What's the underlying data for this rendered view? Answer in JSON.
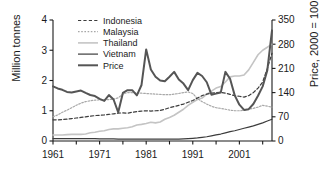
{
  "chart_data": {
    "type": "line",
    "title": "",
    "xlabel": "",
    "ylabel": "Million tonnes",
    "ylabel_right": "Price, 2000 = 100",
    "xlim": [
      1961,
      2008
    ],
    "ylim": [
      0,
      4
    ],
    "ylim_right": [
      0,
      350
    ],
    "yticks": [
      0,
      1,
      2,
      3,
      4
    ],
    "yticks_right": [
      0,
      70,
      140,
      210,
      280,
      350
    ],
    "xticks_labeled": [
      1961,
      1971,
      1981,
      1991,
      2001
    ],
    "xticks_minor_step": 5,
    "grid": false,
    "legend_position": "upper-left-inside",
    "x": [
      1961,
      1962,
      1963,
      1964,
      1965,
      1966,
      1967,
      1968,
      1969,
      1970,
      1971,
      1972,
      1973,
      1974,
      1975,
      1976,
      1977,
      1978,
      1979,
      1980,
      1981,
      1982,
      1983,
      1984,
      1985,
      1986,
      1987,
      1988,
      1989,
      1990,
      1991,
      1992,
      1993,
      1994,
      1995,
      1996,
      1997,
      1998,
      1999,
      2000,
      2001,
      2002,
      2003,
      2004,
      2005,
      2006,
      2007,
      2008
    ],
    "series": [
      {
        "name": "Indonesia",
        "axis": "left",
        "units": "Million tonnes",
        "style": "dashed",
        "color": "#3c3c3c",
        "width": 1.2,
        "values": [
          0.7,
          0.7,
          0.71,
          0.72,
          0.74,
          0.76,
          0.78,
          0.8,
          0.82,
          0.84,
          0.85,
          0.86,
          0.88,
          0.9,
          0.92,
          0.93,
          0.92,
          0.95,
          0.97,
          0.99,
          1.0,
          0.99,
          1.0,
          1.01,
          1.05,
          1.1,
          1.14,
          1.18,
          1.22,
          1.28,
          1.34,
          1.42,
          1.5,
          1.55,
          1.58,
          1.6,
          1.61,
          1.58,
          1.54,
          1.5,
          1.48,
          1.45,
          1.5,
          1.6,
          1.75,
          1.95,
          2.4,
          2.9
        ]
      },
      {
        "name": "Malaysia",
        "axis": "left",
        "units": "Million tonnes",
        "style": "dotted",
        "color": "#a8a8a8",
        "width": 1.2,
        "values": [
          0.8,
          0.86,
          0.95,
          1.02,
          1.1,
          1.18,
          1.25,
          1.3,
          1.33,
          1.35,
          1.36,
          1.37,
          1.37,
          1.38,
          1.43,
          1.55,
          1.6,
          1.6,
          1.59,
          1.58,
          1.57,
          1.56,
          1.55,
          1.54,
          1.53,
          1.53,
          1.55,
          1.57,
          1.6,
          1.62,
          1.57,
          1.4,
          1.3,
          1.22,
          1.15,
          1.1,
          1.08,
          1.05,
          1.02,
          1.0,
          1.0,
          1.02,
          1.05,
          1.08,
          1.12,
          1.18,
          1.15,
          1.12
        ]
      },
      {
        "name": "Thailand",
        "axis": "left",
        "units": "Million tonnes",
        "style": "solid",
        "color": "#c4c4c4",
        "width": 1.6,
        "values": [
          0.2,
          0.2,
          0.2,
          0.21,
          0.22,
          0.22,
          0.22,
          0.23,
          0.27,
          0.29,
          0.32,
          0.34,
          0.38,
          0.4,
          0.4,
          0.42,
          0.44,
          0.47,
          0.53,
          0.55,
          0.58,
          0.62,
          0.6,
          0.63,
          0.72,
          0.78,
          0.85,
          0.95,
          1.05,
          1.18,
          1.28,
          1.37,
          1.42,
          1.55,
          1.65,
          1.75,
          1.8,
          1.95,
          2.12,
          2.15,
          2.15,
          2.18,
          2.35,
          2.6,
          2.85,
          3.0,
          3.1,
          3.2
        ]
      },
      {
        "name": "Vietnam",
        "axis": "left",
        "units": "Million tonnes",
        "style": "solid",
        "color": "#3c3c3c",
        "width": 1.2,
        "values": [
          0.08,
          0.08,
          0.08,
          0.08,
          0.08,
          0.08,
          0.08,
          0.08,
          0.08,
          0.08,
          0.07,
          0.07,
          0.07,
          0.07,
          0.06,
          0.06,
          0.06,
          0.06,
          0.06,
          0.06,
          0.06,
          0.06,
          0.06,
          0.06,
          0.06,
          0.06,
          0.06,
          0.06,
          0.07,
          0.08,
          0.09,
          0.1,
          0.12,
          0.14,
          0.17,
          0.2,
          0.23,
          0.27,
          0.31,
          0.34,
          0.38,
          0.42,
          0.46,
          0.5,
          0.55,
          0.6,
          0.66,
          0.72
        ]
      },
      {
        "name": "Price",
        "axis": "right",
        "units": "Index, 2000 = 100",
        "style": "solid",
        "color": "#555555",
        "width": 2.0,
        "values": [
          158,
          152,
          148,
          142,
          140,
          143,
          146,
          139,
          133,
          130,
          122,
          116,
          133,
          120,
          83,
          139,
          147,
          147,
          132,
          162,
          265,
          207,
          186,
          175,
          173,
          186,
          200,
          178,
          166,
          147,
          176,
          197,
          188,
          170,
          134,
          137,
          140,
          200,
          180,
          132,
          105,
          90,
          92,
          107,
          131,
          158,
          205,
          320
        ]
      }
    ]
  },
  "legend": {
    "entries": [
      {
        "label": "Indonesia"
      },
      {
        "label": "Malaysia"
      },
      {
        "label": "Thailand"
      },
      {
        "label": "Vietnam"
      },
      {
        "label": "Price"
      }
    ]
  },
  "axes": {
    "left_title": "Million tonnes",
    "right_title": "Price, 2000 = 100"
  }
}
